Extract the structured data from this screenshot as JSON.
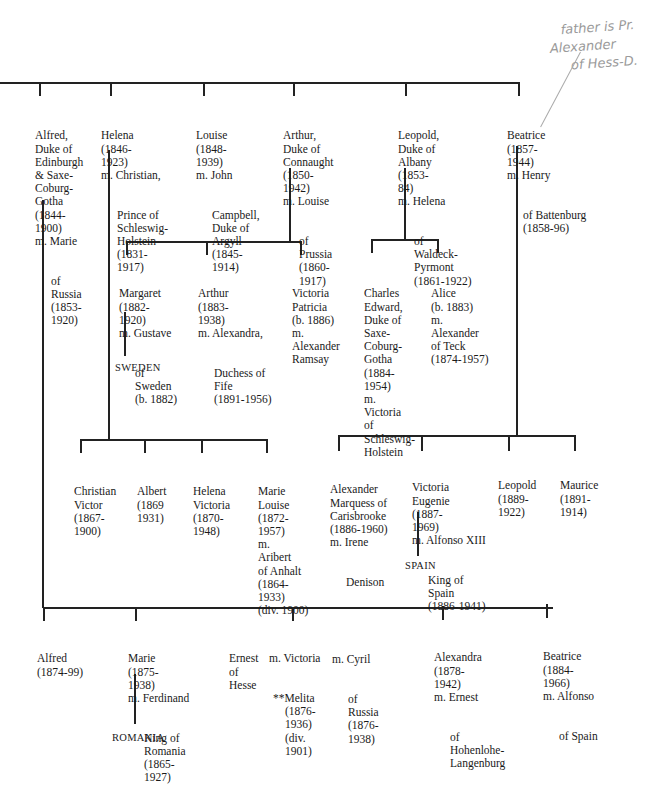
{
  "annotation": {
    "lines": [
      "father is",
      "Pr. Alexander",
      "of Hess-D."
    ]
  },
  "generation1": [
    {
      "id": "alfred",
      "lines": [
        "Alfred,",
        "Duke of",
        "Edinburgh",
        "& Saxe-",
        "Coburg-",
        "Gotha",
        "(1844-",
        "1900)",
        "m. Marie"
      ],
      "spouse": [
        "of",
        "Russia",
        "(1853-",
        "1920)"
      ]
    },
    {
      "id": "helena",
      "lines": [
        "Helena",
        "(1846-",
        "1923)",
        "m. Christian,"
      ],
      "spouse": [
        "Prince of",
        "Schleswig-",
        "Holstein",
        "(1831-",
        "1917)"
      ]
    },
    {
      "id": "louise",
      "lines": [
        "Louise",
        "(1848-",
        "1939)",
        "m. John"
      ],
      "spouse": [
        "Campbell,",
        "Duke of",
        "Argyll",
        "(1845-",
        "1914)"
      ]
    },
    {
      "id": "arthur",
      "lines": [
        "Arthur,",
        "Duke of",
        "Connaught",
        "(1850-",
        "1942)",
        "m. Louise"
      ],
      "spouse": [
        "of",
        "Prussia",
        "(1860-",
        "1917)"
      ]
    },
    {
      "id": "leopold",
      "lines": [
        "Leopold,",
        "Duke of",
        "Albany",
        "(1853-",
        "84)",
        "m. Helena"
      ],
      "spouse": [
        "of",
        "Waldeck-",
        "Pyrmont",
        "(1861-1922)"
      ]
    },
    {
      "id": "beatrice",
      "lines": [
        "Beatrice",
        "(1857-",
        "1944)",
        "m. Henry"
      ],
      "spouse": [
        "of Battenburg",
        "(1858-96)"
      ]
    }
  ],
  "arthur_children": [
    {
      "id": "margaret",
      "lines": [
        "Margaret",
        "(1882-",
        "1920)",
        "m. Gustave"
      ],
      "spouse": [
        "of",
        "Sweden",
        "(b. 1882)"
      ],
      "country": "SWEDEN"
    },
    {
      "id": "arthur-jr",
      "lines": [
        "Arthur",
        "(1883-",
        "1938)",
        "m. Alexandra,"
      ],
      "spouse": [
        "Duchess of",
        "Fife",
        "(1891-1956)"
      ]
    },
    {
      "id": "victoria-patricia",
      "lines": [
        "Victoria",
        "Patricia",
        "(b. 1886)",
        "m.",
        "Alexander",
        "Ramsay"
      ],
      "spouse": []
    }
  ],
  "leopold_children": [
    {
      "id": "charles-edward",
      "lines": [
        "Charles",
        "Edward,",
        "Duke of",
        "Saxe-",
        "Coburg-",
        "Gotha",
        "(1884-",
        "1954)",
        "m.",
        "Victoria",
        "of",
        "Schleswig-",
        "Holstein"
      ],
      "spouse": []
    },
    {
      "id": "alice",
      "lines": [
        "Alice",
        "(b. 1883)",
        "m.",
        "Alexander",
        "of Teck",
        "(1874-1957)"
      ],
      "spouse": []
    }
  ],
  "helena_children": [
    {
      "id": "christian-victor",
      "lines": [
        "Christian",
        "Victor",
        "(1867-",
        "1900)"
      ],
      "spouse": []
    },
    {
      "id": "albert",
      "lines": [
        "Albert",
        "(1869",
        "1931)"
      ],
      "spouse": []
    },
    {
      "id": "helena-victoria",
      "lines": [
        "Helena",
        "Victoria",
        "(1870-",
        "1948)"
      ],
      "spouse": []
    },
    {
      "id": "marie-louise",
      "lines": [
        "Marie",
        "Louise",
        "(1872-",
        "1957)",
        "m.",
        "Aribert",
        "of Anhalt",
        "(1864-",
        "1933)",
        "(div. 1900)"
      ],
      "spouse": []
    }
  ],
  "beatrice_children": [
    {
      "id": "alexander",
      "lines": [
        "Alexander",
        "Marquess of",
        "Carisbrooke",
        "(1886-1960)",
        "m. Irene"
      ],
      "spouse": [
        "Denison"
      ]
    },
    {
      "id": "victoria-eugenie",
      "lines": [
        "Victoria",
        "Eugenie",
        "(1887-",
        "1969)",
        "m. Alfonso XIII"
      ],
      "spouse": [
        "King of",
        "Spain",
        "(1886-1941)"
      ],
      "country": "SPAIN"
    },
    {
      "id": "leopold-b",
      "lines": [
        "Leopold",
        "(1889-",
        "1922)"
      ],
      "spouse": []
    },
    {
      "id": "maurice",
      "lines": [
        "Maurice",
        "(1891-",
        "1914)"
      ],
      "spouse": []
    }
  ],
  "alfred_children": [
    {
      "id": "alfred-jr",
      "lines": [
        "Alfred",
        "(1874-99)"
      ],
      "spouse": []
    },
    {
      "id": "marie",
      "lines": [
        "Marie",
        "(1875-",
        "1938)",
        "m. Ferdinand"
      ],
      "spouse": [
        "King of",
        "Romania",
        "(1865-",
        "1927)"
      ],
      "country": "ROMANIA"
    },
    {
      "id": "ernest",
      "lines": [
        "Ernest",
        "of",
        "Hesse"
      ],
      "spouse": []
    },
    {
      "id": "victoria-melita",
      "lines": [
        "m. Victoria"
      ],
      "spouse": [
        "**Melita",
        "(1876-",
        "1936)",
        "(div.",
        "1901)"
      ]
    },
    {
      "id": "cyril",
      "lines": [
        "m. Cyril"
      ],
      "spouse": [
        "of",
        "Russia",
        "(1876-",
        "1938)"
      ]
    },
    {
      "id": "alexandra",
      "lines": [
        "Alexandra",
        "(1878-",
        "1942)",
        "m. Ernest"
      ],
      "spouse": [
        "of",
        "Hohenlohe-",
        "Langenburg"
      ]
    },
    {
      "id": "beatrice-a",
      "lines": [
        "Beatrice",
        "(1884-",
        "1966)",
        "m. Alfonso"
      ],
      "spouse": [
        "of Spain"
      ]
    }
  ]
}
